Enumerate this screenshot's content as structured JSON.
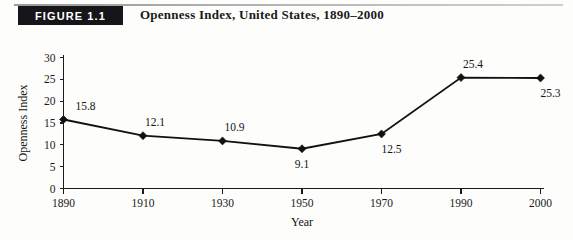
{
  "figure": {
    "badge_label": "FIGURE 1.1",
    "title": "Openness Index, United States, 1890–2000"
  },
  "chart_data": {
    "type": "line",
    "title": "Openness Index, United States, 1890–2000",
    "xlabel": "Year",
    "ylabel": "Openness Index",
    "categories": [
      "1890",
      "1910",
      "1930",
      "1950",
      "1970",
      "1990",
      "2000"
    ],
    "values": [
      15.8,
      12.1,
      10.9,
      9.1,
      12.5,
      25.4,
      25.3
    ],
    "point_labels": [
      "15.8",
      "12.1",
      "10.9",
      "9.1",
      "12.5",
      "25.4",
      "25.3"
    ],
    "label_positions": [
      "above",
      "above",
      "above",
      "below",
      "below-right",
      "above",
      "below-right"
    ],
    "ylim": [
      0,
      30
    ],
    "yticks": [
      0,
      5,
      10,
      15,
      20,
      25,
      30
    ],
    "ytick_labels": [
      "0",
      "5",
      "10",
      "15",
      "20",
      "25",
      "30"
    ],
    "xtick_labels": [
      "1890",
      "1910",
      "1930",
      "1950",
      "1970",
      "1990",
      "2000"
    ],
    "grid": false,
    "legend": "none",
    "marker": "diamond",
    "line_color": "#111111",
    "axis_color": "#1c1c1c"
  }
}
